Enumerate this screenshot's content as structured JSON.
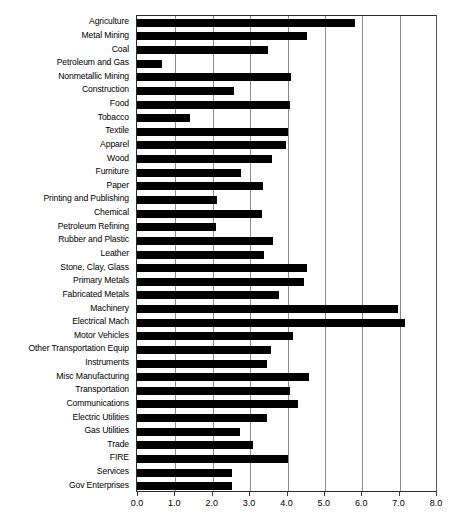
{
  "chart_data": {
    "type": "bar",
    "orientation": "horizontal",
    "title": "",
    "xlabel": "",
    "ylabel": "",
    "xlim": [
      0.0,
      8.0
    ],
    "xticks": [
      "0.0",
      "1.0",
      "2.0",
      "3.0",
      "4.0",
      "5.0",
      "6.0",
      "7.0",
      "8.0"
    ],
    "xtick_values": [
      0.0,
      1.0,
      2.0,
      3.0,
      4.0,
      5.0,
      6.0,
      7.0,
      8.0
    ],
    "grid": "vertical",
    "legend": "none",
    "bar_color": "#000000",
    "grid_color": "#8a8a8a",
    "axis_color": "#2b2b2b",
    "categories": [
      "Agriculture",
      "Metal Mining",
      "Coal",
      "Petroleum and Gas",
      "Nonmetallic Mining",
      "Construction",
      "Food",
      "Tobacco",
      "Textile",
      "Apparel",
      "Wood",
      "Furniture",
      "Paper",
      "Printing and Publishing",
      "Chemical",
      "Petroleum Refining",
      "Rubber and Plastic",
      "Leather",
      "Stone, Clay, Glass",
      "Primary Metals",
      "Fabricated Metals",
      "Machinery",
      "Electrical Mach",
      "Motor Vehicles",
      "Other Transportation Equip",
      "Instruments",
      "Misc Manufacturing",
      "Transportation",
      "Communications",
      "Electric Utilities",
      "Gas Utilities",
      "Trade",
      "FIRE",
      "Services",
      "Gov Enterprises"
    ],
    "values": [
      5.82,
      4.56,
      3.5,
      0.66,
      4.13,
      2.59,
      4.1,
      1.41,
      4.03,
      3.98,
      3.62,
      2.77,
      3.36,
      2.14,
      3.35,
      2.12,
      3.64,
      3.41,
      4.54,
      4.48,
      3.81,
      6.98,
      7.18,
      4.18,
      3.59,
      3.48,
      4.6,
      4.1,
      4.31,
      3.47,
      2.76,
      3.11,
      4.04,
      2.53,
      2.53
    ]
  }
}
